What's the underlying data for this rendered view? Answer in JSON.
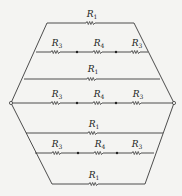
{
  "diagram": {
    "type": "resistor-network",
    "nodes": {
      "left": {
        "x": 11,
        "y": 103
      },
      "right": {
        "x": 174,
        "y": 103
      }
    },
    "outline": {
      "top_left": {
        "x": 47,
        "y": 23
      },
      "top_right": {
        "x": 134,
        "y": 23
      },
      "bottom_left": {
        "x": 52,
        "y": 184
      },
      "bottom_right": {
        "x": 145,
        "y": 184
      }
    },
    "branches": [
      {
        "y": 23,
        "x1": 47,
        "x2": 134,
        "resistors": [
          {
            "label": "R",
            "sub": "1",
            "x": 91
          }
        ]
      },
      {
        "y": 52,
        "x1": 36,
        "x2": 148,
        "resistors": [
          {
            "label": "R",
            "sub": "3",
            "x": 56
          },
          {
            "label": "R",
            "sub": "4",
            "x": 98
          },
          {
            "label": "R",
            "sub": "3",
            "x": 136
          }
        ],
        "junctions": [
          77,
          116
        ]
      },
      {
        "y": 79,
        "x1": 24,
        "x2": 160,
        "resistors": [
          {
            "label": "R",
            "sub": "1",
            "x": 92
          }
        ]
      },
      {
        "y": 103,
        "x1": 11,
        "x2": 174,
        "resistors": [
          {
            "label": "R",
            "sub": "3",
            "x": 56
          },
          {
            "label": "R",
            "sub": "4",
            "x": 98
          },
          {
            "label": "R",
            "sub": "3",
            "x": 137
          }
        ],
        "junctions": [
          77,
          116
        ]
      },
      {
        "y": 133,
        "x1": 26,
        "x2": 163,
        "resistors": [
          {
            "label": "R",
            "sub": "1",
            "x": 92
          }
        ]
      },
      {
        "y": 153,
        "x1": 35,
        "x2": 154,
        "resistors": [
          {
            "label": "R",
            "sub": "3",
            "x": 56
          },
          {
            "label": "R",
            "sub": "4",
            "x": 98
          },
          {
            "label": "R",
            "sub": "3",
            "x": 136
          }
        ],
        "junctions": [
          78,
          117
        ]
      },
      {
        "y": 184,
        "x1": 52,
        "x2": 145,
        "resistors": [
          {
            "label": "R",
            "sub": "1",
            "x": 93
          }
        ]
      }
    ]
  },
  "labels": {
    "r1_a": "R",
    "r1_a_sub": "1",
    "r3_a": "R",
    "r3_a_sub": "3",
    "r4_a": "R",
    "r4_a_sub": "4",
    "r3_b": "R",
    "r3_b_sub": "3",
    "r1_b": "R",
    "r1_b_sub": "1",
    "r3_c": "R",
    "r3_c_sub": "3",
    "r4_b": "R",
    "r4_b_sub": "4",
    "r3_d": "R",
    "r3_d_sub": "3",
    "r1_c": "R",
    "r1_c_sub": "1",
    "r3_e": "R",
    "r3_e_sub": "3",
    "r4_c": "R",
    "r4_c_sub": "4",
    "r3_f": "R",
    "r3_f_sub": "3",
    "r1_d": "R",
    "r1_d_sub": "1"
  }
}
